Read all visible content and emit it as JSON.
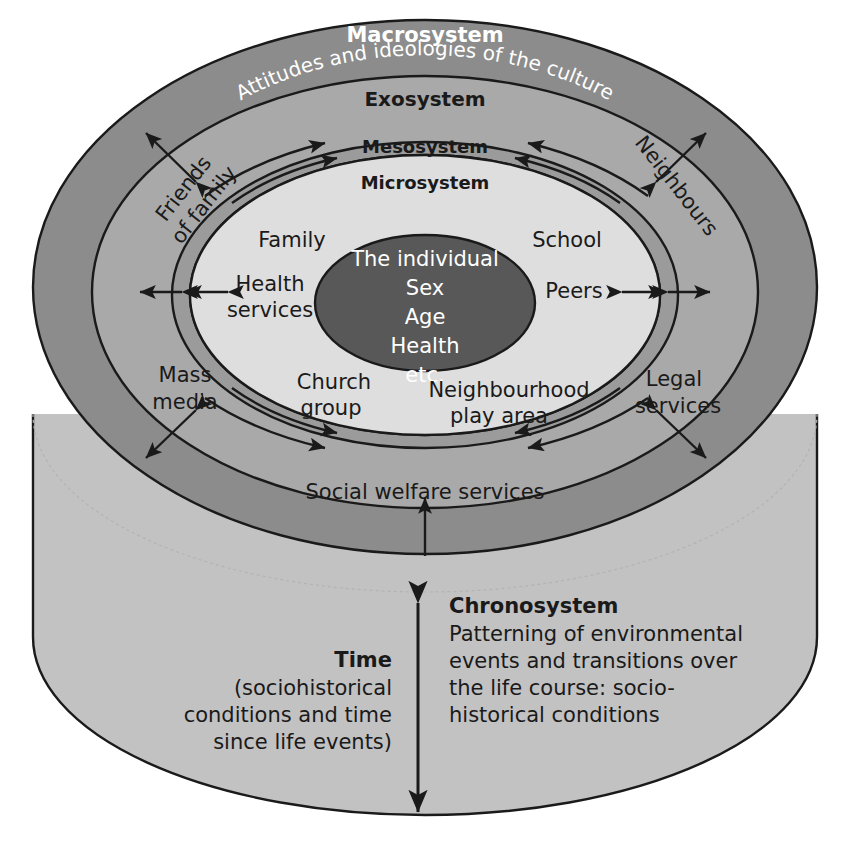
{
  "diagram": {
    "rings": {
      "macrosystem": {
        "label": "Macrosystem",
        "subtitle": "Attitudes and ideologies of the culture",
        "color": "#8c8c8c"
      },
      "exosystem": {
        "label": "Exosystem",
        "color": "#a9a9a9"
      },
      "mesosystem": {
        "label": "Mesosystem",
        "color": "#9b9b9b"
      },
      "microsystem": {
        "label": "Microsystem",
        "color": "#dedede"
      },
      "core": {
        "color": "#585858",
        "lines": [
          "The individual",
          "Sex",
          "Age",
          "Health",
          "etc."
        ]
      }
    },
    "microsystem_items": [
      {
        "id": "family",
        "text": "Family"
      },
      {
        "id": "health-services",
        "text": "Health\nservices"
      },
      {
        "id": "school",
        "text": "School"
      },
      {
        "id": "peers",
        "text": "Peers"
      },
      {
        "id": "church-group",
        "text": "Church\ngroup"
      },
      {
        "id": "neighbourhood-play-area",
        "text": "Neighbourhood\nplay area"
      }
    ],
    "exosystem_items": [
      {
        "id": "friends-of-family",
        "text": "Friends\nof family",
        "rotation": -52
      },
      {
        "id": "neighbours",
        "text": "Neighbours",
        "rotation": 52
      },
      {
        "id": "mass-media",
        "text": "Mass\nmedia",
        "rotation": 0
      },
      {
        "id": "legal-services",
        "text": "Legal\nservices",
        "rotation": 0
      },
      {
        "id": "social-welfare-services",
        "text": "Social welfare services",
        "rotation": 0
      }
    ],
    "chronosystem": {
      "heading": "Chronosystem",
      "body_lines": [
        "Patterning of environmental",
        "events and transitions over",
        "the life course: socio-",
        "historical conditions"
      ],
      "color": "#c2c2c2"
    },
    "time": {
      "heading": "Time",
      "body_lines": [
        "(sociohistorical",
        "conditions and time",
        "since life events)"
      ]
    },
    "colors": {
      "outline": "#1a1a1a",
      "text_dark": "#1a1a1a",
      "text_light": "#ffffff",
      "cylinder": "#c2c2c2",
      "background": "#ffffff"
    }
  }
}
